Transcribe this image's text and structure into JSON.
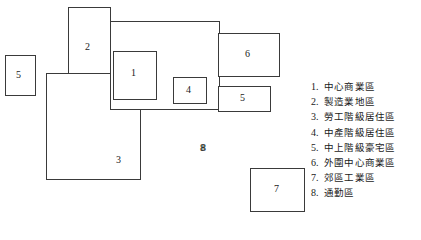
{
  "diagram": {
    "title": "",
    "zones": [
      {
        "id": "zone-5-left",
        "label": "5",
        "x": 5,
        "y": 55,
        "w": 31,
        "h": 41,
        "label_x": 16,
        "label_y": 70
      },
      {
        "id": "zone-2",
        "label": "2",
        "x": 68,
        "y": 7,
        "w": 43,
        "h": 136,
        "label_x": 85,
        "label_y": 42
      },
      {
        "id": "zone-3",
        "label": "3",
        "x": 46,
        "y": 73,
        "w": 95,
        "h": 107,
        "label_x": 116,
        "label_y": 155
      },
      {
        "id": "zone-8",
        "label": "8",
        "x": 110,
        "y": 21,
        "w": 110,
        "h": 89,
        "label_x": 200,
        "label_y": 143
      },
      {
        "id": "zone-1",
        "label": "1",
        "x": 113,
        "y": 51,
        "w": 44,
        "h": 49,
        "label_x": 131,
        "label_y": 68
      },
      {
        "id": "zone-4",
        "label": "4",
        "x": 173,
        "y": 77,
        "w": 34,
        "h": 27,
        "label_x": 186,
        "label_y": 85
      },
      {
        "id": "zone-6",
        "label": "6",
        "x": 218,
        "y": 33,
        "w": 62,
        "h": 44,
        "label_x": 245,
        "label_y": 49
      },
      {
        "id": "zone-5-right",
        "label": "5",
        "x": 218,
        "y": 86,
        "w": 53,
        "h": 26,
        "label_x": 240,
        "label_y": 93
      },
      {
        "id": "zone-7",
        "label": "7",
        "x": 250,
        "y": 168,
        "w": 55,
        "h": 44,
        "label_x": 274,
        "label_y": 184
      }
    ],
    "free_labels": [
      {
        "id": "label-8",
        "text": "8",
        "x": 201,
        "y": 143
      }
    ]
  },
  "legend": {
    "items": [
      {
        "num": "1.",
        "text": "中心商業區"
      },
      {
        "num": "2.",
        "text": "製造業地區"
      },
      {
        "num": "3.",
        "text": "勞工階級居住區"
      },
      {
        "num": "4.",
        "text": "中產階級居住區"
      },
      {
        "num": "5.",
        "text": "中上階級豪宅區"
      },
      {
        "num": "6.",
        "text": "外圍中心商業區"
      },
      {
        "num": "7.",
        "text": "郊區工業區"
      },
      {
        "num": "8.",
        "text": "通勤區"
      }
    ]
  },
  "colors": {
    "stroke": "#3a3a3a",
    "text": "#1a1a1a",
    "background": "#ffffff"
  }
}
